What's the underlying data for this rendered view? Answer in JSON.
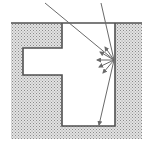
{
  "diagram": {
    "type": "cross-section",
    "colors": {
      "background": "#ffffff",
      "substrate_fill": "#c8c8c8",
      "wall_stroke": "#505050",
      "ray_stroke": "#6a6a6a"
    },
    "elements": {
      "substrate": "stippled material",
      "cavity": "open rectangular cavity",
      "side_pocket": "rectangular recess on left wall",
      "incident_ray_1": "ray entering from top-left hitting right wall",
      "incident_ray_2": "ray entering from top reflecting to floor",
      "scatter_arrows": "diffuse reflection arrows from right wall"
    }
  }
}
